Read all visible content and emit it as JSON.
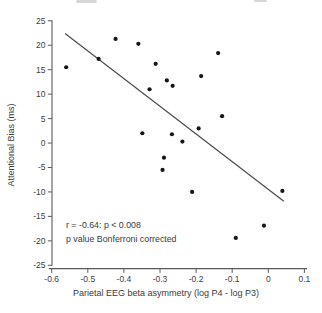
{
  "figure": {
    "xlabel": "Parietal EEG beta asymmetry (log P4 - log P3)",
    "ylabel": "Attentional Bias (ms)",
    "annotation": {
      "line1": "r = -0.64: p < 0.008",
      "line2": "p value Bonferroni corrected"
    }
  },
  "chart_data": {
    "type": "scatter",
    "title": "",
    "xlabel": "Parietal EEG beta asymmetry (log P4 - log P3)",
    "ylabel": "Attentional Bias (ms)",
    "xlim": [
      -0.6,
      0.1
    ],
    "ylim": [
      -25,
      25
    ],
    "grid": false,
    "legend": null,
    "x_ticks": [
      -0.6,
      -0.5,
      -0.4,
      -0.3,
      -0.2,
      -0.1,
      0,
      0.1
    ],
    "x_tick_labels": [
      "-0.6",
      "-0.5",
      "-0.4",
      "-0.3",
      "-0.2",
      "-0.1",
      "0",
      "0.1"
    ],
    "y_ticks": [
      25,
      20,
      15,
      10,
      5,
      0,
      -5,
      -10,
      -15,
      -20,
      -25
    ],
    "y_tick_labels": [
      "25",
      "20",
      "15",
      "10",
      "5",
      "0",
      "-5",
      "-10",
      "-15",
      "-20",
      "-25"
    ],
    "points": [
      [
        -0.56,
        15.5
      ],
      [
        -0.47,
        17.2
      ],
      [
        -0.423,
        21.3
      ],
      [
        -0.36,
        20.3
      ],
      [
        -0.312,
        16.2
      ],
      [
        -0.329,
        11.0
      ],
      [
        -0.349,
        2.0
      ],
      [
        -0.139,
        18.4
      ],
      [
        -0.186,
        13.7
      ],
      [
        -0.281,
        12.8
      ],
      [
        -0.265,
        11.7
      ],
      [
        -0.128,
        5.5
      ],
      [
        -0.193,
        3.0
      ],
      [
        -0.267,
        1.8
      ],
      [
        -0.238,
        0.3
      ],
      [
        -0.289,
        -3.0
      ],
      [
        -0.293,
        -5.5
      ],
      [
        -0.211,
        -10.0
      ],
      [
        0.039,
        -9.8
      ],
      [
        -0.012,
        -16.9
      ],
      [
        -0.09,
        -19.4
      ]
    ],
    "regression_line": {
      "x1": -0.563,
      "y1": 22.4,
      "x2": 0.043,
      "y2": -11.9
    },
    "annotation_lines": [
      "r = -0.64: p < 0.008",
      "p value Bonferroni corrected"
    ],
    "colors": {
      "point": "#161616",
      "regression_line": "#474747",
      "axis": "#5a5a5a",
      "text": "#3e3e3e",
      "background": "#ffffff"
    }
  }
}
